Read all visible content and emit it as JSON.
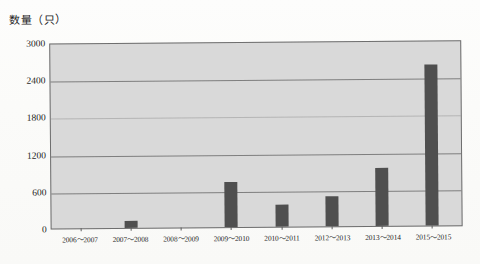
{
  "axis_title": "数量（只）",
  "chart_data": {
    "type": "bar",
    "title": "",
    "ylabel": "数量（只）",
    "xlabel": "",
    "ylim": [
      0,
      3000
    ],
    "ytick_labels": [
      "0",
      "600",
      "1200",
      "1800",
      "2400",
      "3000"
    ],
    "yticks": [
      0,
      600,
      1200,
      1800,
      2400,
      3000
    ],
    "grid": true,
    "legend": "none",
    "categories": [
      "2006～2007",
      "2007～2008",
      "2008～2009",
      "2009～2010",
      "2010～2011",
      "2012～2013",
      "2013～2014",
      "2015～2015"
    ],
    "values": [
      0,
      110,
      0,
      730,
      360,
      480,
      930,
      2600
    ],
    "bar_color": "#4f4f4f",
    "plot_background": "#d9d9d9"
  }
}
